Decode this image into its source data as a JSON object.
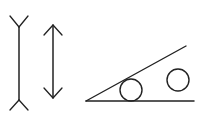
{
  "diagram": {
    "title": "",
    "background": "#ffffff",
    "stroke_color": "#222222",
    "figures": [
      {
        "id": "muller-lyer-fins-out",
        "type": "line-with-outward-fins",
        "line": {
          "x": 19,
          "y1": 27,
          "y2": 100
        },
        "top_fins": [
          [
            10,
            16
          ],
          [
            28,
            16
          ]
        ],
        "bottom_fins": [
          [
            10,
            110
          ],
          [
            28,
            110
          ]
        ]
      },
      {
        "id": "double-arrow",
        "type": "line-with-arrowheads",
        "line": {
          "x": 53,
          "y1": 25,
          "y2": 98
        }
      },
      {
        "id": "angle-with-circles",
        "type": "angle",
        "base": {
          "x1": 86,
          "y1": 101,
          "x2": 194,
          "y2": 101
        },
        "slant": {
          "x1": 86,
          "y1": 101,
          "x2": 186,
          "y2": 46
        },
        "circles": [
          {
            "cx": 131,
            "cy": 90,
            "r": 11
          },
          {
            "cx": 178,
            "cy": 80,
            "r": 11
          }
        ]
      }
    ]
  }
}
